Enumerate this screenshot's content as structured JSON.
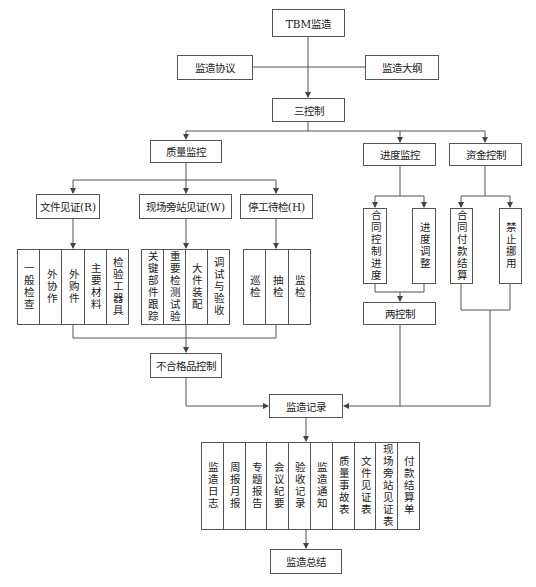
{
  "diagram": {
    "root": "TBM监造",
    "side_inputs": [
      "监造协议",
      "监造大纲"
    ],
    "three_controls": "三控制",
    "branches": {
      "quality": {
        "label": "质量监控",
        "sub": [
          {
            "label": "文件见证(R)",
            "items": [
              "一般检查",
              "外协作",
              "外购件",
              "主要材料",
              "检验工器具"
            ]
          },
          {
            "label": "现场旁站见证(W)",
            "items": [
              "关键部件跟踪",
              "重要检测试验",
              "大件装配",
              "调试与验收"
            ]
          },
          {
            "label": "停工待检(H)",
            "items": [
              "巡检",
              "抽检",
              "监检"
            ]
          }
        ],
        "nonconforming": "不合格品控制"
      },
      "schedule": {
        "label": "进度监控",
        "items": [
          "合同控制进度",
          "进度调整"
        ]
      },
      "funds": {
        "label": "资金控制",
        "items": [
          "合同付款结算",
          "禁止挪用"
        ]
      },
      "two_controls": "两控制"
    },
    "records": {
      "label": "监造记录",
      "items": [
        "监造日志",
        "周报月报",
        "专题报告",
        "会议纪要",
        "验收记录",
        "监造通知",
        "质量事故表",
        "文件见证表",
        "现场旁站见证表",
        "付款结算单"
      ]
    },
    "summary": "监造总结"
  }
}
